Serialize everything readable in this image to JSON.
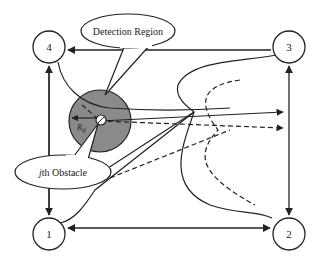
{
  "diagram": {
    "type": "path-planning-diagram",
    "nodes": [
      {
        "id": "1",
        "label": "1",
        "cx": 49,
        "cy": 234
      },
      {
        "id": "2",
        "label": "2",
        "cx": 289,
        "cy": 234
      },
      {
        "id": "3",
        "label": "3",
        "cx": 289,
        "cy": 47
      },
      {
        "id": "4",
        "label": "4",
        "cx": 49,
        "cy": 47
      }
    ],
    "callouts": {
      "detection_region": {
        "label": "Detection Region"
      },
      "obstacle": {
        "label_prefix": "j",
        "label_suffix": "th Obstacle"
      }
    },
    "detection_circle": {
      "fill": "#8a8a8a",
      "radius_label": "R_kj",
      "radius_label_main": "R",
      "radius_label_sub": "kj"
    },
    "colors": {
      "line": "#222222",
      "node_fill": "#ffffff",
      "region_fill": "#8a8a8a"
    }
  }
}
